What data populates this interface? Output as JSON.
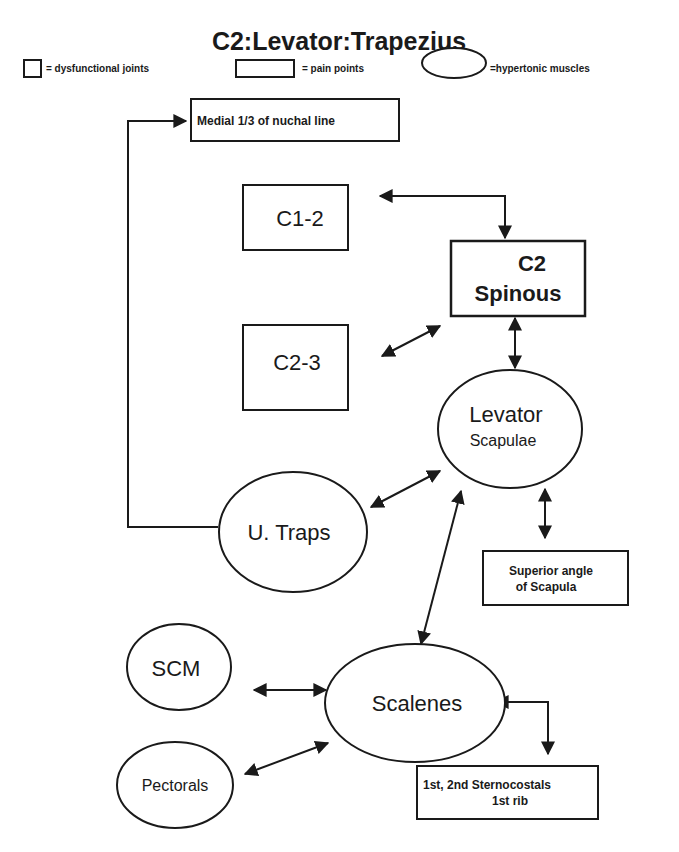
{
  "title": "C2:Levator:Trapezius",
  "legend": {
    "joints": "= dysfunctional joints",
    "pain": "= pain points",
    "muscles": "=hypertonic  muscles"
  },
  "nodes": {
    "nuchal": {
      "type": "pain_point",
      "label": "Medial 1/3 of nuchal line"
    },
    "c12": {
      "type": "dysfunctional_joint",
      "label": "C1-2"
    },
    "c23": {
      "type": "dysfunctional_joint",
      "label": "C2-3"
    },
    "c2spinous": {
      "type": "pain_point",
      "line1": "C2",
      "line2": "Spinous"
    },
    "levator": {
      "type": "hypertonic_muscle",
      "line1": "Levator",
      "line2": "Scapulae"
    },
    "utraps": {
      "type": "hypertonic_muscle",
      "label": "U. Traps"
    },
    "superior": {
      "type": "pain_point",
      "line1": "Superior angle",
      "line2": "of  Scapula"
    },
    "scm": {
      "type": "hypertonic_muscle",
      "label": "SCM"
    },
    "scalenes": {
      "type": "hypertonic_muscle",
      "label": "Scalenes"
    },
    "pectorals": {
      "type": "hypertonic_muscle",
      "label": "Pectorals"
    },
    "sterno": {
      "type": "pain_point",
      "line1": "1st, 2nd Sternocostals",
      "line2": "1st rib"
    }
  },
  "edges": [
    {
      "from": "utraps",
      "to": "nuchal",
      "direction": "one-way"
    },
    {
      "from": "c12",
      "to": "c2spinous",
      "direction": "two-way"
    },
    {
      "from": "c23",
      "to": "c2spinous",
      "direction": "two-way"
    },
    {
      "from": "c2spinous",
      "to": "levator",
      "direction": "two-way"
    },
    {
      "from": "utraps",
      "to": "levator",
      "direction": "two-way"
    },
    {
      "from": "levator",
      "to": "superior",
      "direction": "two-way"
    },
    {
      "from": "scalenes",
      "to": "levator",
      "direction": "two-way"
    },
    {
      "from": "scm",
      "to": "scalenes",
      "direction": "two-way"
    },
    {
      "from": "pectorals",
      "to": "scalenes",
      "direction": "two-way"
    },
    {
      "from": "scalenes",
      "to": "sterno",
      "direction": "two-way"
    }
  ]
}
